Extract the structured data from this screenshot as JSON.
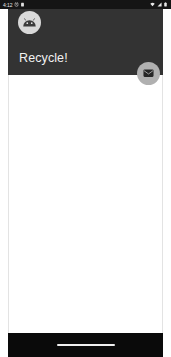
{
  "status_bar": {
    "clock": "4:12",
    "left_icons": [
      "alarm-icon",
      "battery-saver-icon"
    ],
    "right_icons": [
      "wifi-icon",
      "cell-signal-icon",
      "battery-icon"
    ],
    "background_color": "#151515",
    "text_color": "#e8e8e8"
  },
  "app_bar": {
    "title": "Recycle!",
    "avatar_icon": "android-robot-icon",
    "background_color": "#333333",
    "title_color": "#f2f2f2",
    "avatar_background": "#d9d9d9"
  },
  "fab": {
    "icon": "email-icon",
    "label": "Compose email",
    "background_color": "#b0b0b0",
    "icon_color": "#262626"
  },
  "content": {
    "list_items": [],
    "background_color": "#ffffff",
    "border_color": "#e3e3e3"
  },
  "nav_bar": {
    "gesture_pill_label": "Home gesture bar",
    "background_color": "#0a0a0a",
    "pill_color": "#f0f0f0"
  }
}
